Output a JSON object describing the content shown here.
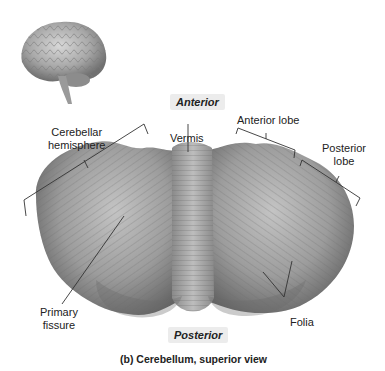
{
  "figure": {
    "caption": "(b) Cerebellum, superior view",
    "orientation": {
      "top": "Anterior",
      "bottom": "Posterior"
    },
    "labels": {
      "cerebellar_hemisphere": [
        "Cerebellar",
        "hemisphere"
      ],
      "vermis": "Vermis",
      "anterior_lobe": "Anterior lobe",
      "posterior_lobe": [
        "Posterior",
        "lobe"
      ],
      "primary_fissure": [
        "Primary",
        "fissure"
      ],
      "folia": "Folia"
    },
    "inset": "brain-lateral-view-thumbnail",
    "colors": {
      "tissue_light": "#c8c8c8",
      "tissue_mid": "#9a9a9a",
      "tissue_dark": "#5e5e5e",
      "leader_line": "#333333",
      "label_bg": "#ececec"
    }
  }
}
